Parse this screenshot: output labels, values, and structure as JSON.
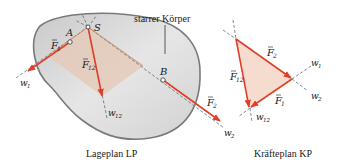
{
  "lageplan": {
    "caption": "Lageplan LP",
    "body_label": "starrer Körper",
    "points": {
      "A": "A",
      "B": "B",
      "S": "S"
    },
    "forces": {
      "F1": "F",
      "F1_sub": "1",
      "F2": "F",
      "F2_sub": "2",
      "F12": "F",
      "F12_sub": "12"
    },
    "lines": {
      "w1": "w",
      "w1_sub": "1",
      "w2": "w",
      "w2_sub": "2",
      "w12": "w",
      "w12_sub": "12"
    }
  },
  "kraefteplan": {
    "caption": "Kräfteplan KP",
    "forces": {
      "F1": "F",
      "F1_sub": "1",
      "F2": "F",
      "F2_sub": "2",
      "F12": "F",
      "F12_sub": "12"
    },
    "lines": {
      "w1": "w",
      "w1_sub": "1",
      "w2": "w",
      "w2_sub": "2",
      "w12": "w",
      "w12_sub": "12"
    }
  },
  "colors": {
    "force": "#e0402a",
    "body_fill": "#d9d9d9",
    "body_stroke": "#7a7a7a",
    "triangle_fill": "#f6dccf",
    "lageplan_fill": "#e3c9b6",
    "line": "#7a8a9a"
  }
}
